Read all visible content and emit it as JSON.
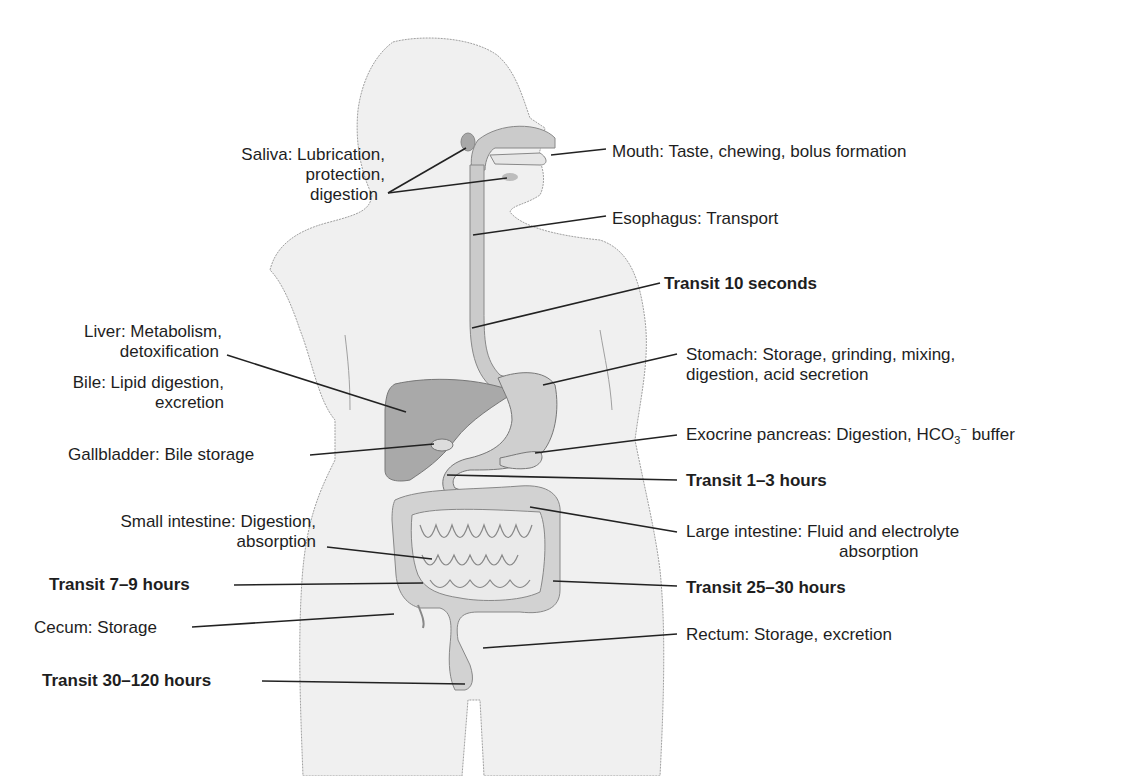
{
  "figure": {
    "colors": {
      "body_fill": "#efefef",
      "body_outline": "#9a9a9a",
      "organ_fill": "#cfcfcf",
      "liver_fill": "#a9a9a9",
      "leader_line": "#222222",
      "text": "#1e1e1e"
    }
  },
  "labels": {
    "saliva": {
      "line1": "Saliva: Lubrication,",
      "line2": "protection,",
      "line3": "digestion"
    },
    "mouth": {
      "text": "Mouth: Taste, chewing, bolus formation"
    },
    "esophagus": {
      "text": "Esophagus: Transport"
    },
    "transit_esophagus": {
      "text": "Transit 10 seconds"
    },
    "liver": {
      "line1": "Liver: Metabolism,",
      "line2": "detoxification"
    },
    "bile": {
      "line1": "Bile: Lipid digestion,",
      "line2": "excretion"
    },
    "stomach": {
      "line1": "Stomach: Storage, grinding, mixing,",
      "line2": "digestion, acid secretion"
    },
    "gallbladder": {
      "text": "Gallbladder: Bile storage"
    },
    "pancreas": {
      "prefix": "Exocrine pancreas: Digestion, HCO",
      "sub": "3",
      "sup": "−",
      "suffix": " buffer"
    },
    "transit_stomach": {
      "text": "Transit 1–3 hours"
    },
    "small_intestine": {
      "line1": "Small intestine: Digestion,",
      "line2": "absorption"
    },
    "large_intestine": {
      "line1": "Large intestine: Fluid and electrolyte",
      "line2": "absorption"
    },
    "transit_small_intestine": {
      "text": "Transit 7–9 hours"
    },
    "transit_large_intestine": {
      "text": "Transit 25–30 hours"
    },
    "cecum": {
      "text": "Cecum: Storage"
    },
    "rectum": {
      "text": "Rectum: Storage, excretion"
    },
    "transit_total": {
      "text": "Transit 30–120 hours"
    }
  }
}
